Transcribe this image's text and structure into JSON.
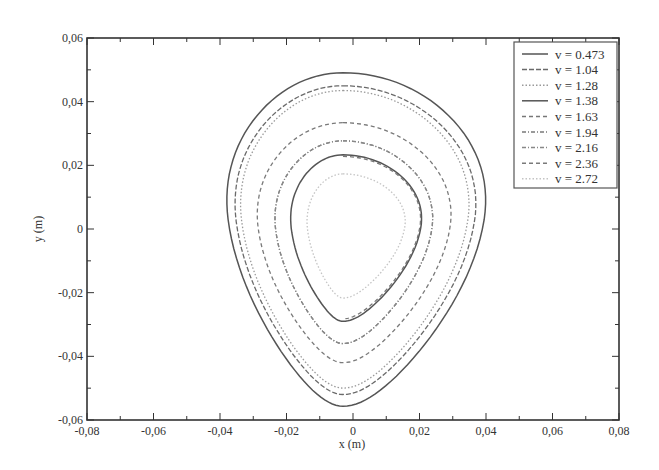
{
  "chart_data": {
    "type": "line",
    "title": "",
    "xlabel": "x (m)",
    "ylabel": "y (m)",
    "xlim": [
      -0.08,
      0.08
    ],
    "ylim": [
      -0.06,
      0.06
    ],
    "x_ticks": [
      -0.08,
      -0.06,
      -0.04,
      -0.02,
      0,
      0.02,
      0.04,
      0.06,
      0.08
    ],
    "x_tick_labels": [
      "-0,08",
      "-0,06",
      "-0,04",
      "-0,02",
      "0",
      "0,02",
      "0,04",
      "0,06",
      "0,08"
    ],
    "y_ticks": [
      0.06,
      0.04,
      0.02,
      0,
      -0.02,
      -0.04,
      -0.06
    ],
    "y_tick_labels": [
      "0,06",
      "0,04",
      "0,02",
      "0",
      "-0,02",
      "-0,04",
      "-0,06"
    ],
    "grid": false,
    "legend_position": "upper right",
    "series": [
      {
        "name": "v = 0.473",
        "style": "solid",
        "color": "#555555",
        "top": 0.0491,
        "bottom": -0.0557,
        "left": -0.0385,
        "right": 0.0406
      },
      {
        "name": "v = 1.04",
        "style": "dashed-dense",
        "color": "#6a6a6a",
        "top": 0.045,
        "bottom": -0.052,
        "left": -0.036,
        "right": 0.0376
      },
      {
        "name": "v = 1.28",
        "style": "dotted",
        "color": "#9a9a9a",
        "top": 0.0435,
        "bottom": -0.05,
        "left": -0.0343,
        "right": 0.0355
      },
      {
        "name": "v = 1.38",
        "style": "solid",
        "color": "#555555",
        "top": 0.0233,
        "bottom": -0.029,
        "left": -0.019,
        "right": 0.021
      },
      {
        "name": "v = 1.63",
        "style": "dashed",
        "color": "#777777",
        "top": 0.0228,
        "bottom": -0.0282,
        "left": -0.0186,
        "right": 0.0207
      },
      {
        "name": "v = 1.94",
        "style": "dash-dot",
        "color": "#7a7a7a",
        "top": 0.0277,
        "bottom": -0.036,
        "left": -0.0238,
        "right": 0.0244
      },
      {
        "name": "v = 2.16",
        "style": "dash-dot",
        "color": "#888888",
        "top": 0.0277,
        "bottom": -0.036,
        "left": -0.0238,
        "right": 0.0244
      },
      {
        "name": "v = 2.36",
        "style": "dashed",
        "color": "#7a7a7a",
        "top": 0.0334,
        "bottom": -0.042,
        "left": -0.0292,
        "right": 0.03
      },
      {
        "name": "v = 2.72",
        "style": "dotted",
        "color": "#c4c4c4",
        "top": 0.0173,
        "bottom": -0.0217,
        "left": -0.014,
        "right": 0.016
      }
    ],
    "annotations": []
  },
  "legend": {
    "entries": [
      {
        "label": "v = 0.473"
      },
      {
        "label": "v = 1.04"
      },
      {
        "label": "v = 1.28"
      },
      {
        "label": "v = 1.38"
      },
      {
        "label": "v = 1.63"
      },
      {
        "label": "v = 1.94"
      },
      {
        "label": "v = 2.16"
      },
      {
        "label": "v = 2.36"
      },
      {
        "label": "v = 2.72"
      }
    ]
  },
  "axes": {
    "xlabel": "x (m)",
    "ylabel": "y (m)"
  }
}
